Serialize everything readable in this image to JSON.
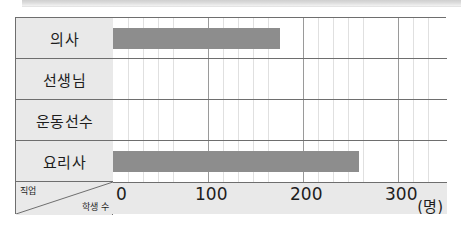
{
  "chart_data": {
    "type": "bar",
    "orientation": "horizontal",
    "title": "",
    "xlabel": "학생 수",
    "ylabel": "직업",
    "unit": "(명)",
    "categories": [
      "의사",
      "선생님",
      "운동선수",
      "요리사"
    ],
    "values": [
      170,
      0,
      0,
      250
    ],
    "xlim": [
      0,
      340
    ],
    "xticks": [
      0,
      100,
      200,
      300
    ],
    "xtick_labels": [
      "0",
      "100",
      "200",
      "300"
    ],
    "minor_tick_step": 20,
    "grid": true,
    "legend": null,
    "series": [
      {
        "name": "학생 수",
        "values": [
          170,
          0,
          0,
          250
        ]
      }
    ],
    "colors": {
      "bar": "#8d8d8d",
      "grid_major": "#9a9a9a",
      "grid_minor": "#e0e0e0",
      "border": "#6e6e6e",
      "header_fill": "#e9e9e9",
      "plot_fill": "#ffffff",
      "text": "#1d1d1d"
    }
  },
  "axis": {
    "corner_top_label": "직업",
    "corner_bottom_label": "학생 수",
    "unit_label": "(명)"
  }
}
